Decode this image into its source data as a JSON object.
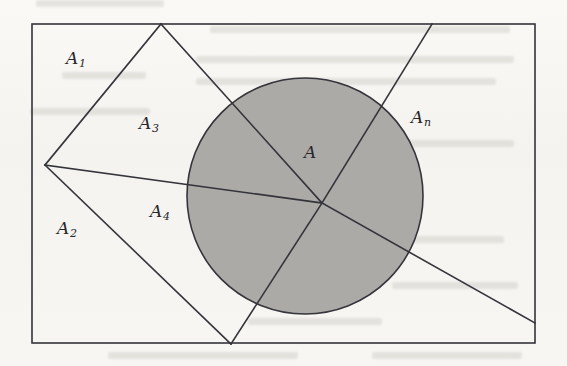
{
  "figure": {
    "kind": "geometric-diagram",
    "background_color": "#f6f5f2",
    "stroke_color": "#34343a",
    "circle_fill_color": "#a9a8a5",
    "canvas": {
      "width": 567,
      "height": 366
    },
    "outer_rectangle": {
      "x": 32,
      "y": 24,
      "width": 503,
      "height": 319
    },
    "circle": {
      "cx": 305,
      "cy": 196,
      "r": 118
    },
    "vertex_point": {
      "x": 322,
      "y": 203
    },
    "labels": [
      {
        "id": "A1",
        "base": "A",
        "sub": "1",
        "x": 66,
        "y": 58,
        "text": "A₁"
      },
      {
        "id": "A3",
        "base": "A",
        "sub": "3",
        "x": 139,
        "y": 123,
        "text": "A₃"
      },
      {
        "id": "A2",
        "base": "A",
        "sub": "2",
        "x": 57,
        "y": 228,
        "text": "A₂"
      },
      {
        "id": "A4",
        "base": "A",
        "sub": "4",
        "x": 150,
        "y": 211,
        "text": "A₄"
      },
      {
        "id": "A",
        "base": "A",
        "sub": "",
        "x": 304,
        "y": 152,
        "text": "A"
      },
      {
        "id": "An",
        "base": "A",
        "sub": "n",
        "x": 411,
        "y": 117,
        "text": "Aₙ"
      }
    ],
    "segments": [
      {
        "name": "quad-top-left-edge",
        "x1": 161,
        "y1": 24,
        "x2": 45,
        "y2": 165
      },
      {
        "name": "quad-bottom-left-edge",
        "x1": 45,
        "y1": 165,
        "x2": 231,
        "y2": 344
      },
      {
        "name": "quad-right-upper-edge",
        "x1": 161,
        "y1": 24,
        "x2": 322,
        "y2": 203
      },
      {
        "name": "quad-right-lower-edge",
        "x1": 231,
        "y1": 344,
        "x2": 322,
        "y2": 203
      },
      {
        "name": "ray-to-left-vertex",
        "x1": 45,
        "y1": 165,
        "x2": 322,
        "y2": 203
      },
      {
        "name": "ray-upper-right",
        "x1": 322,
        "y1": 203,
        "x2": 432,
        "y2": 24
      },
      {
        "name": "ray-lower-right",
        "x1": 322,
        "y1": 203,
        "x2": 535,
        "y2": 323
      }
    ]
  }
}
